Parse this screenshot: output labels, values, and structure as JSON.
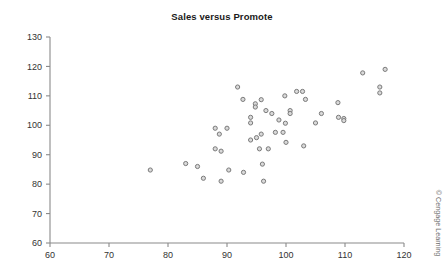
{
  "figure": {
    "title": "Sales versus Promote",
    "credit": "© Cengage Learning",
    "background_color": "#ffffff",
    "marker_fill": "#d9d9d9",
    "marker_stroke": "#7a7a7a",
    "axis_color": "#8a8a8a"
  },
  "chart_data": {
    "type": "scatter",
    "title": "Sales versus Promote",
    "xlabel": "",
    "ylabel": "",
    "xlim": [
      60,
      120
    ],
    "ylim": [
      60,
      130
    ],
    "xticks": [
      60,
      70,
      80,
      90,
      100,
      110,
      120
    ],
    "yticks": [
      60,
      70,
      80,
      90,
      100,
      110,
      120,
      130
    ],
    "xtick_labels": [
      "60",
      "70",
      "80",
      "90",
      "100",
      "110",
      "120"
    ],
    "ytick_labels": [
      "60",
      "70",
      "80",
      "90",
      "100",
      "110",
      "120",
      "130"
    ],
    "grid": false,
    "legend": null,
    "marker": "open-circle",
    "series": [
      {
        "name": "Sales versus Promote",
        "points": [
          [
            77.0,
            84.8
          ],
          [
            83.0,
            87.0
          ],
          [
            85.0,
            86.0
          ],
          [
            86.0,
            82.0
          ],
          [
            88.0,
            99.0
          ],
          [
            88.0,
            92.0
          ],
          [
            88.7,
            97.0
          ],
          [
            89.0,
            91.2
          ],
          [
            89.0,
            81.0
          ],
          [
            90.0,
            99.0
          ],
          [
            90.3,
            84.8
          ],
          [
            91.8,
            113.0
          ],
          [
            92.7,
            108.8
          ],
          [
            92.8,
            84.0
          ],
          [
            94.0,
            102.7
          ],
          [
            94.0,
            100.8
          ],
          [
            94.0,
            95.0
          ],
          [
            94.8,
            107.3
          ],
          [
            94.8,
            106.2
          ],
          [
            95.0,
            95.8
          ],
          [
            95.5,
            92.0
          ],
          [
            95.8,
            108.7
          ],
          [
            95.8,
            97.0
          ],
          [
            96.0,
            86.8
          ],
          [
            96.2,
            81.0
          ],
          [
            96.6,
            105.0
          ],
          [
            97.0,
            92.0
          ],
          [
            97.6,
            104.0
          ],
          [
            98.2,
            97.6
          ],
          [
            98.8,
            101.8
          ],
          [
            99.5,
            97.6
          ],
          [
            99.8,
            110.0
          ],
          [
            99.9,
            100.7
          ],
          [
            100.0,
            94.2
          ],
          [
            100.7,
            105.0
          ],
          [
            100.7,
            104.0
          ],
          [
            101.8,
            111.5
          ],
          [
            102.8,
            111.5
          ],
          [
            103.0,
            93.0
          ],
          [
            103.3,
            108.8
          ],
          [
            105.0,
            100.8
          ],
          [
            106.0,
            104.0
          ],
          [
            108.8,
            107.7
          ],
          [
            108.9,
            102.7
          ],
          [
            109.8,
            102.3
          ],
          [
            109.8,
            101.6
          ],
          [
            113.0,
            117.8
          ],
          [
            115.9,
            113.0
          ],
          [
            115.9,
            111.0
          ],
          [
            116.8,
            119.0
          ]
        ]
      }
    ]
  }
}
